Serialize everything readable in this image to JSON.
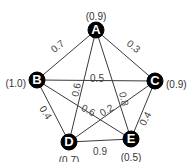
{
  "graph": {
    "nodes": [
      {
        "id": "A",
        "label": "A",
        "weight": "(0.9)"
      },
      {
        "id": "B",
        "label": "B",
        "weight": "(1.0)"
      },
      {
        "id": "C",
        "label": "C",
        "weight": "(0.9)"
      },
      {
        "id": "D",
        "label": "D",
        "weight": "(0.7)"
      },
      {
        "id": "E",
        "label": "E",
        "weight": "(0.5)"
      }
    ],
    "edges": [
      {
        "from": "A",
        "to": "B",
        "weight": "0.7"
      },
      {
        "from": "A",
        "to": "C",
        "weight": "0.3"
      },
      {
        "from": "A",
        "to": "D",
        "weight": "0.6"
      },
      {
        "from": "A",
        "to": "E",
        "weight": "0.8"
      },
      {
        "from": "B",
        "to": "C",
        "weight": "0.5"
      },
      {
        "from": "B",
        "to": "D",
        "weight": "0.4"
      },
      {
        "from": "B",
        "to": "E",
        "weight": "0.6"
      },
      {
        "from": "C",
        "to": "D",
        "weight": "0.2"
      },
      {
        "from": "C",
        "to": "E",
        "weight": "0.4"
      },
      {
        "from": "D",
        "to": "E",
        "weight": "0.9"
      }
    ]
  }
}
